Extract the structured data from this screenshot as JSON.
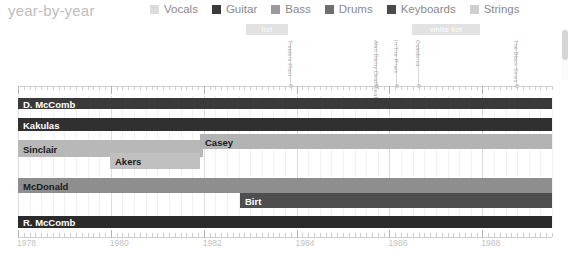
{
  "header": {
    "title": "year-by-year",
    "legend": [
      {
        "label": "Vocals",
        "color": "#dcdcdc"
      },
      {
        "label": "Guitar",
        "color": "#3a3a3a"
      },
      {
        "label": "Bass",
        "color": "#9a9a9a"
      },
      {
        "label": "Drums",
        "color": "#6e6e6e"
      },
      {
        "label": "Keyboards",
        "color": "#4a4a4a"
      },
      {
        "label": "Strings",
        "color": "#cfcfcf"
      }
    ]
  },
  "banners": [
    {
      "label": "liot",
      "x": 246,
      "width": 42
    },
    {
      "label": "white liot",
      "x": 412,
      "width": 68
    }
  ],
  "events": [
    {
      "label": "Treelers Plain",
      "x": 290
    },
    {
      "label": "Alan Darby Deathbeat",
      "x": 376
    },
    {
      "label": "In The Pines",
      "x": 396
    },
    {
      "label": "Caledonia",
      "x": 418
    },
    {
      "label": "The Black Skies",
      "x": 516
    }
  ],
  "axis": {
    "x_start": 1978,
    "x_end": 1989.5,
    "major_ticks": [
      1978,
      1980,
      1982,
      1984,
      1986,
      1988
    ],
    "tick_step": 0.125,
    "year_labels": [
      "1978",
      "1980",
      "1982",
      "1984",
      "1986",
      "1988"
    ]
  },
  "chart_data": {
    "type": "bar",
    "title": "year-by-year",
    "xlabel": "",
    "ylabel": "",
    "xlim": [
      1978,
      1989.5
    ],
    "grid": true,
    "legend_position": "top",
    "categories": [
      "D. McComb",
      "Kakulas",
      "Sinclair",
      "Akers",
      "Casey",
      "McDonald",
      "Birt",
      "R. McComb"
    ],
    "rows": [
      {
        "name": "D. McComb",
        "label": "D. McComb",
        "role": "Guitar",
        "color": "#3a3a3a",
        "text_color": "#ffffff",
        "top": 2,
        "height": 11,
        "x": 0,
        "width": 534,
        "start": 1978,
        "end": 1989.5
      },
      {
        "name": "Kakulas",
        "label": "Kakulas",
        "role": "Strings",
        "color": "#303030",
        "text_color": "#ffffff",
        "top": 22,
        "height": 13,
        "x": 0,
        "width": 534,
        "start": 1978,
        "end": 1989.5
      },
      {
        "name": "Sinclair",
        "label": "Sinclair",
        "role": "Bass",
        "color": "#b8b8b8",
        "text_color": "#1a1a1a",
        "top": 44,
        "height": 17,
        "x": 0,
        "width": 185,
        "start": 1978,
        "end": 1982.0
      },
      {
        "name": "Casey",
        "label": "Casey",
        "role": "Bass",
        "color": "#b3b3b3",
        "text_color": "#1a1a1a",
        "top": 38,
        "height": 15,
        "x": 182,
        "width": 352,
        "start": 1982.0,
        "end": 1989.5
      },
      {
        "name": "Akers",
        "label": "Akers",
        "role": "Keyboards",
        "color": "#c0c0c0",
        "text_color": "#1a1a1a",
        "top": 57,
        "height": 16,
        "x": 92,
        "width": 90,
        "start": 1980.0,
        "end": 1982.0
      },
      {
        "name": "McDonald",
        "label": "McDonald",
        "role": "Drums",
        "color": "#8e8e8e",
        "text_color": "#1a1a1a",
        "top": 82,
        "height": 15,
        "x": 0,
        "width": 534,
        "start": 1978,
        "end": 1989.5
      },
      {
        "name": "Birt",
        "label": "Birt",
        "role": "Drums",
        "color": "#4e4e4e",
        "text_color": "#ffffff",
        "top": 97,
        "height": 15,
        "x": 222,
        "width": 312,
        "start": 1982.8,
        "end": 1989.5
      },
      {
        "name": "R. McComb",
        "label": "R. McComb",
        "role": "Guitar",
        "color": "#2b2b2b",
        "text_color": "#ffffff",
        "top": 120,
        "height": 12,
        "x": 0,
        "width": 534,
        "start": 1978,
        "end": 1989.5
      }
    ]
  }
}
